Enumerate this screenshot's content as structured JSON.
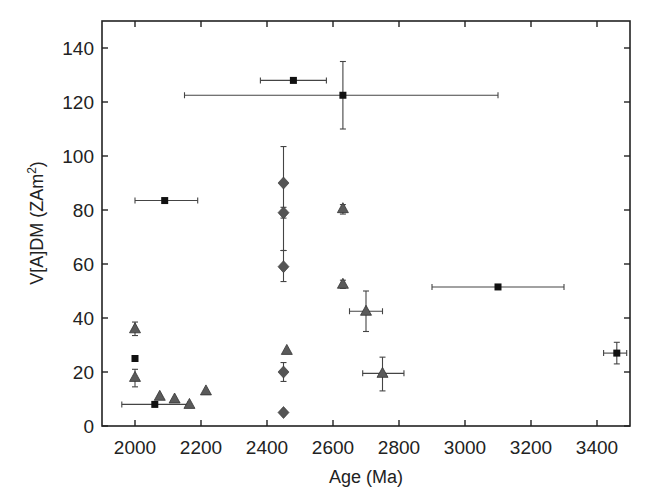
{
  "chart_data": {
    "type": "scatter",
    "title": "",
    "xlabel": "Age (Ma)",
    "ylabel": "V[A]DM (ZAm²)",
    "ylabel_parts": {
      "main": "V[A]DM (ZAm",
      "sup": "2",
      "close": ")"
    },
    "xlim": [
      1900,
      3500
    ],
    "ylim": [
      0,
      150
    ],
    "xticks": [
      2000,
      2200,
      2400,
      2600,
      2800,
      3000,
      3200,
      3400
    ],
    "yticks": [
      0,
      20,
      40,
      60,
      80,
      100,
      120,
      140
    ],
    "grid": false,
    "legend": null,
    "colors": {
      "square": "#111111",
      "diamond": "#555555",
      "triangle": "#5a5a5a",
      "errorbar": "#444444",
      "axis": "#222222"
    },
    "series": [
      {
        "name": "squares",
        "marker": "square",
        "points": [
          {
            "x": 2090,
            "y": 83.5,
            "xmin": 2000,
            "xmax": 2190
          },
          {
            "x": 2480,
            "y": 128,
            "xmin": 2380,
            "xmax": 2580
          },
          {
            "x": 2630,
            "y": 122.5,
            "xmin": 2150,
            "xmax": 3100,
            "ymin": 110,
            "ymax": 135
          },
          {
            "x": 2000,
            "y": 25
          },
          {
            "x": 2060,
            "y": 8,
            "xmin": 1960,
            "xmax": 2160
          },
          {
            "x": 3100,
            "y": 51.5,
            "xmin": 2900,
            "xmax": 3300
          },
          {
            "x": 3460,
            "y": 27,
            "xmin": 3420,
            "xmax": 3490,
            "ymin": 23,
            "ymax": 31
          }
        ]
      },
      {
        "name": "diamonds",
        "marker": "diamond",
        "points": [
          {
            "x": 2450,
            "y": 90,
            "ymin": 65,
            "ymax": 103.5
          },
          {
            "x": 2450,
            "y": 79,
            "ymin": 77,
            "ymax": 81
          },
          {
            "x": 2450,
            "y": 59,
            "ymin": 53.5,
            "ymax": 65
          },
          {
            "x": 2450,
            "y": 20,
            "ymin": 16.5,
            "ymax": 23.5
          },
          {
            "x": 2450,
            "y": 5
          }
        ]
      },
      {
        "name": "triangles",
        "marker": "triangle",
        "points": [
          {
            "x": 2000,
            "y": 36,
            "ymin": 33.5,
            "ymax": 38.5
          },
          {
            "x": 2000,
            "y": 18,
            "ymin": 14.5,
            "ymax": 21
          },
          {
            "x": 2075,
            "y": 11
          },
          {
            "x": 2120,
            "y": 10
          },
          {
            "x": 2165,
            "y": 8
          },
          {
            "x": 2215,
            "y": 13
          },
          {
            "x": 2460,
            "y": 28
          },
          {
            "x": 2630,
            "y": 80.5,
            "ymin": 78.5,
            "ymax": 82
          },
          {
            "x": 2630,
            "y": 52.5,
            "ymin": 51,
            "ymax": 54
          },
          {
            "x": 2700,
            "y": 42.5,
            "xmin": 2650,
            "xmax": 2750,
            "ymin": 35,
            "ymax": 50
          },
          {
            "x": 2750,
            "y": 19.5,
            "xmin": 2690,
            "xmax": 2815,
            "ymin": 13,
            "ymax": 25.5
          }
        ]
      }
    ]
  }
}
